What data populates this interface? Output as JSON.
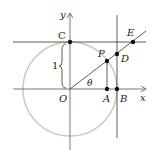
{
  "diagram": {
    "labels": {
      "y_axis": "y",
      "x_axis": "x",
      "C": "C",
      "E": "E",
      "P": "P",
      "D": "D",
      "O": "O",
      "A": "A",
      "B": "B",
      "theta": "θ",
      "radius": "1"
    },
    "colors": {
      "circle": "#c8c8c8",
      "lines": "#333333",
      "points": "#111111"
    }
  }
}
